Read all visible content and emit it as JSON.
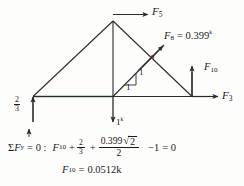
{
  "figure": {
    "colors": {
      "member": "#2b2b2b",
      "bottom_chord_highlight": "#1f6b32",
      "intersection_marker": "#b03a48",
      "text": "#1a1a1a",
      "background": "#fdfdfc"
    }
  },
  "forces": [
    {
      "key": "F5",
      "name": "F",
      "subscript": "5",
      "label": "F5",
      "direction": "right",
      "value": "",
      "units": ""
    },
    {
      "key": "F8",
      "name": "F",
      "subscript": "8",
      "label": "F8 = 0.399k",
      "direction": "up-right-45",
      "value": "0.399",
      "units": "k"
    },
    {
      "key": "F10",
      "name": "F",
      "subscript": "10",
      "label": "F10",
      "direction": "up",
      "value": "",
      "units": ""
    },
    {
      "key": "F3",
      "name": "F",
      "subscript": "3",
      "label": "F3",
      "direction": "right",
      "value": "",
      "units": ""
    },
    {
      "key": "applied_load",
      "name": "",
      "subscript": "",
      "label": "1k",
      "direction": "down",
      "value": "1",
      "units": "k"
    },
    {
      "key": "reaction_left",
      "name": "",
      "subscript": "",
      "label": "2/3",
      "direction": "up",
      "value_numerator": "2",
      "value_denominator": "3",
      "units": ""
    }
  ],
  "labels": {
    "f5_symbol": "F",
    "f5_sub": "5",
    "f8_symbol": "F",
    "f8_sub": "8",
    "f8_equals": "= 0.399",
    "f8_unit": "k",
    "f10_symbol": "F",
    "f10_sub": "10",
    "f3_symbol": "F",
    "f3_sub": "3",
    "load_value": "1",
    "load_unit": "k",
    "reaction_numerator": "2",
    "reaction_denominator": "3",
    "slope_vertical": "1",
    "slope_horizontal": "1"
  },
  "equation": {
    "convention": "+↑",
    "sum_symbol": "Σ",
    "sum_var": "F",
    "sum_sub": "y",
    "equals_zero": "= 0 :",
    "term1_symbol": "F",
    "term1_sub": "10",
    "plus1": "+",
    "term2_numerator": "2",
    "term2_denominator": "3",
    "plus2": "+",
    "term3_numerator_coeff": "0.399",
    "term3_radical": "√",
    "term3_radicand": "2",
    "term3_denominator": "2",
    "minus_term": "−1",
    "equals_result": "= 0"
  },
  "result": {
    "symbol": "F",
    "subscript": "10",
    "equals": "=",
    "value": "0.0512",
    "unit": "k"
  }
}
